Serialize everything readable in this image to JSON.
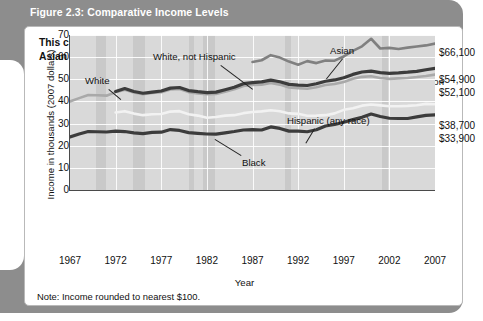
{
  "figure": {
    "title": "Figure 2.3:  Comparative Income Levels",
    "subtitle": "This chart shows the median household incomes of white, black, Hispanic, and Asian workers in 2007.",
    "note": "Note: Income rounded to nearest $100."
  },
  "legend": {
    "recession_label": "Recession",
    "recession_color": "#dcdcdc"
  },
  "colors": {
    "plot_background": "#d9d9d9",
    "recession_band": "#c9c9c9",
    "gridline": "#ffffff",
    "axis": "#4a4a4a",
    "white_series": "#a9a9a9",
    "white_not_hispanic_series": "#3c3c3c",
    "asian_series": "#808080",
    "hispanic_series": "#f2f2f2",
    "black_series": "#3c3c3c",
    "panel": "#8d8d8d",
    "card": "#ffffff"
  },
  "annotations": [
    {
      "name": "white",
      "text": "White"
    },
    {
      "name": "white-not-hispanic",
      "text": "White, not Hispanic"
    },
    {
      "name": "asian",
      "text": "Asian"
    },
    {
      "name": "hispanic",
      "text": "Hispanic (any race)"
    },
    {
      "name": "black",
      "text": "Black"
    }
  ],
  "end_labels": [
    {
      "name": "asian",
      "text": "$66,100",
      "top": 20
    },
    {
      "name": "white-not-hispanic",
      "text": "$54,900",
      "top": 47
    },
    {
      "name": "white",
      "text": "$52,100",
      "top": 60
    },
    {
      "name": "hispanic",
      "text": "$38,700",
      "top": 93
    },
    {
      "name": "black",
      "text": "$33,900",
      "top": 106
    }
  ],
  "chart_data": {
    "type": "line",
    "title": "Comparative Income Levels",
    "xlabel": "Year",
    "ylabel": "Income in thousands (2007 dollars)",
    "xlim": [
      1967,
      2007
    ],
    "ylim": [
      0,
      70
    ],
    "ytick_labels": [
      "0",
      "10",
      "20",
      "30",
      "40",
      "50",
      "60",
      "70"
    ],
    "ytick_values": [
      0,
      10,
      20,
      30,
      40,
      50,
      60,
      70
    ],
    "xtick_labels": [
      "1967",
      "1972",
      "1977",
      "1982",
      "1987",
      "1992",
      "1997",
      "2002",
      "2007"
    ],
    "xtick_values": [
      1967,
      1972,
      1977,
      1982,
      1987,
      1992,
      1997,
      2002,
      2007
    ],
    "grid": true,
    "legend_position": "top-right",
    "units": "thousands of 2007 dollars",
    "recession_bands": [
      {
        "start": 1969.9,
        "end": 1970.9
      },
      {
        "start": 1973.9,
        "end": 1975.2
      },
      {
        "start": 1980.0,
        "end": 1980.6
      },
      {
        "start": 1981.6,
        "end": 1982.9
      },
      {
        "start": 1990.6,
        "end": 1991.2
      },
      {
        "start": 2001.2,
        "end": 2001.9
      }
    ],
    "series": [
      {
        "name": "White",
        "color": "#a9a9a9",
        "final_value": 52.1,
        "final_label": "$52,100",
        "x": [
          1967,
          1968,
          1969,
          1970,
          1971,
          1972,
          1973,
          1974,
          1975,
          1976,
          1977,
          1978,
          1979,
          1980,
          1981,
          1982,
          1983,
          1984,
          1985,
          1986,
          1987,
          1988,
          1989,
          1990,
          1991,
          1992,
          1993,
          1994,
          1995,
          1996,
          1997,
          1998,
          1999,
          2000,
          2001,
          2002,
          2003,
          2004,
          2005,
          2006,
          2007
        ],
        "values": [
          40.0,
          41.5,
          42.9,
          42.8,
          42.6,
          44.2,
          45.3,
          44.0,
          43.3,
          43.8,
          44.2,
          45.4,
          45.6,
          44.2,
          43.6,
          43.3,
          43.4,
          44.4,
          45.5,
          47.0,
          47.4,
          47.6,
          48.3,
          47.6,
          46.3,
          46.0,
          45.7,
          46.4,
          47.4,
          47.9,
          48.8,
          50.2,
          51.1,
          51.4,
          50.6,
          50.2,
          50.4,
          50.6,
          51.0,
          51.5,
          52.1
        ]
      },
      {
        "name": "White, not Hispanic",
        "color": "#3c3c3c",
        "final_value": 54.9,
        "final_label": "$54,900",
        "x": [
          1972,
          1973,
          1974,
          1975,
          1976,
          1977,
          1978,
          1979,
          1980,
          1981,
          1982,
          1983,
          1984,
          1985,
          1986,
          1987,
          1988,
          1989,
          1990,
          1991,
          1992,
          1993,
          1994,
          1995,
          1996,
          1997,
          1998,
          1999,
          2000,
          2001,
          2002,
          2003,
          2004,
          2005,
          2006,
          2007
        ],
        "values": [
          44.5,
          45.8,
          44.5,
          43.7,
          44.2,
          44.7,
          46.0,
          46.3,
          44.9,
          44.4,
          44.0,
          44.2,
          45.3,
          46.4,
          48.0,
          48.5,
          48.8,
          49.6,
          48.9,
          47.7,
          47.4,
          47.2,
          48.0,
          49.1,
          49.7,
          50.7,
          52.2,
          53.3,
          53.7,
          53.0,
          52.7,
          52.9,
          53.2,
          53.6,
          54.3,
          54.9
        ]
      },
      {
        "name": "Asian",
        "color": "#808080",
        "final_value": 66.1,
        "final_label": "$66,100",
        "x": [
          1987,
          1988,
          1989,
          1990,
          1991,
          1992,
          1993,
          1994,
          1995,
          1996,
          1997,
          1998,
          1999,
          2000,
          2001,
          2002,
          2003,
          2004,
          2005,
          2006,
          2007
        ],
        "values": [
          57.8,
          58.6,
          60.9,
          59.8,
          58.0,
          56.6,
          58.2,
          57.3,
          58.5,
          58.4,
          60.3,
          62.8,
          64.9,
          68.3,
          63.9,
          64.2,
          63.7,
          64.3,
          64.8,
          65.3,
          66.1
        ]
      },
      {
        "name": "Hispanic (any race)",
        "color": "#f2f2f2",
        "final_value": 38.7,
        "final_label": "$38,700",
        "x": [
          1972,
          1973,
          1974,
          1975,
          1976,
          1977,
          1978,
          1979,
          1980,
          1981,
          1982,
          1983,
          1984,
          1985,
          1986,
          1987,
          1988,
          1989,
          1990,
          1991,
          1992,
          1993,
          1994,
          1995,
          1996,
          1997,
          1998,
          1999,
          2000,
          2001,
          2002,
          2003,
          2004,
          2005,
          2006,
          2007
        ],
        "values": [
          35.0,
          35.6,
          34.5,
          33.8,
          34.2,
          34.3,
          35.4,
          35.6,
          34.2,
          33.6,
          32.6,
          33.0,
          33.6,
          33.8,
          34.7,
          35.2,
          35.5,
          36.0,
          35.6,
          34.6,
          34.4,
          33.5,
          33.6,
          33.8,
          34.6,
          36.2,
          36.9,
          38.1,
          38.6,
          38.2,
          37.8,
          37.8,
          38.0,
          38.3,
          38.9,
          38.7
        ]
      },
      {
        "name": "Black",
        "color": "#3c3c3c",
        "final_value": 33.9,
        "final_label": "$33,900",
        "x": [
          1967,
          1968,
          1969,
          1970,
          1971,
          1972,
          1973,
          1974,
          1975,
          1976,
          1977,
          1978,
          1979,
          1980,
          1981,
          1982,
          1983,
          1984,
          1985,
          1986,
          1987,
          1988,
          1989,
          1990,
          1991,
          1992,
          1993,
          1994,
          1995,
          1996,
          1997,
          1998,
          1999,
          2000,
          2001,
          2002,
          2003,
          2004,
          2005,
          2006,
          2007
        ],
        "values": [
          24.0,
          25.3,
          26.4,
          26.3,
          26.2,
          26.6,
          26.4,
          25.8,
          25.5,
          26.0,
          26.1,
          27.3,
          26.9,
          25.9,
          25.6,
          25.3,
          25.2,
          25.8,
          26.4,
          27.1,
          27.3,
          27.1,
          28.5,
          27.8,
          26.6,
          26.6,
          26.3,
          27.2,
          28.9,
          29.6,
          30.6,
          31.8,
          32.8,
          34.3,
          33.2,
          32.4,
          32.3,
          32.3,
          33.0,
          33.7,
          33.9
        ]
      }
    ]
  }
}
